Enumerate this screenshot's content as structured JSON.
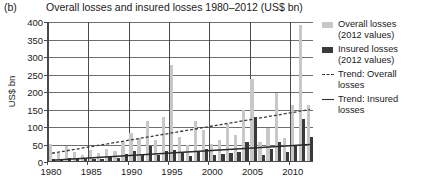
{
  "panel": {
    "label": "(b)"
  },
  "header": {
    "title": "Overall losses and insured losses 1980–2012 (US$ bn)"
  },
  "axes": {
    "ylabel": "US$ bn",
    "yticks": [
      0,
      50,
      100,
      150,
      200,
      250,
      300,
      350,
      400
    ],
    "xticks": [
      1980,
      1985,
      1990,
      1995,
      2000,
      2005,
      2010
    ]
  },
  "legend": [
    {
      "marker": "swatch-light",
      "label": "Overall losses (2012 values)"
    },
    {
      "marker": "swatch-dark",
      "label": "Insured losses (2012 values)"
    },
    {
      "marker": "dashed-line",
      "label": "Trend: Overall losses"
    },
    {
      "marker": "solid-line",
      "label": "Trend: Insured losses"
    }
  ],
  "colors": {
    "overall_bar": "#c8c8c8",
    "insured_bar": "#3a3a3a",
    "trend_overall": "#3a3a3a",
    "trend_insured": "#2a2a2a",
    "gridline": "#6e6e6e",
    "axis": "#4a4a4a",
    "background": "#ffffff"
  },
  "chart_data": {
    "type": "bar",
    "title": "Overall losses and insured losses 1980–2012 (US$ bn)",
    "xlabel": "",
    "ylabel": "US$ bn",
    "ylim": [
      0,
      400
    ],
    "xlim": [
      1979.5,
      2012.5
    ],
    "grid": true,
    "legend_position": "right",
    "categories": [
      1980,
      1981,
      1982,
      1983,
      1984,
      1985,
      1986,
      1987,
      1988,
      1989,
      1990,
      1991,
      1992,
      1993,
      1994,
      1995,
      1996,
      1997,
      1998,
      1999,
      2000,
      2001,
      2002,
      2003,
      2004,
      2005,
      2006,
      2007,
      2008,
      2009,
      2010,
      2011,
      2012
    ],
    "series": [
      {
        "name": "Overall losses (2012 values)",
        "color": "#c8c8c8",
        "values": [
          48,
          22,
          42,
          25,
          18,
          32,
          22,
          35,
          30,
          55,
          80,
          65,
          115,
          60,
          125,
          275,
          70,
          45,
          115,
          90,
          50,
          60,
          105,
          75,
          145,
          235,
          55,
          95,
          195,
          65,
          160,
          390,
          160
        ]
      },
      {
        "name": "Insured losses (2012 values)",
        "color": "#3a3a3a",
        "values": [
          7,
          4,
          8,
          10,
          5,
          7,
          5,
          11,
          8,
          20,
          28,
          20,
          42,
          18,
          28,
          32,
          22,
          14,
          28,
          34,
          16,
          20,
          22,
          26,
          54,
          125,
          18,
          34,
          55,
          26,
          45,
          120,
          70
        ]
      }
    ],
    "trends": [
      {
        "name": "Trend: Overall losses",
        "style": "dashed",
        "color": "#3a3a3a",
        "x": [
          1980,
          2012
        ],
        "y": [
          25,
          150
        ]
      },
      {
        "name": "Trend: Insured losses",
        "style": "solid",
        "color": "#2a2a2a",
        "x": [
          1980,
          2012
        ],
        "y": [
          5,
          50
        ]
      }
    ]
  }
}
